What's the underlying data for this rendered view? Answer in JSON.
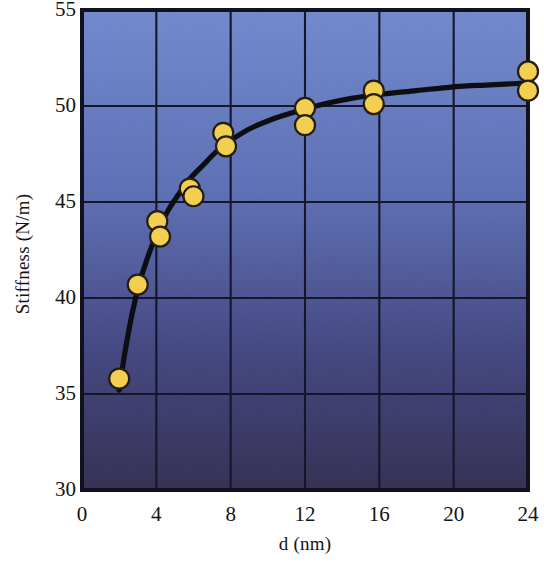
{
  "chart_data": {
    "type": "scatter",
    "title": "",
    "xlabel": "d (nm)",
    "ylabel": "Stiffness (N/m)",
    "xlim": [
      0,
      24
    ],
    "ylim": [
      30,
      55
    ],
    "xticks": [
      "0",
      "4",
      "8",
      "12",
      "16",
      "20",
      "24"
    ],
    "xtick_values": [
      0,
      4,
      8,
      12,
      16,
      20,
      24
    ],
    "yticks": [
      "30",
      "35",
      "40",
      "45",
      "50",
      "55"
    ],
    "ytick_values": [
      30,
      35,
      40,
      45,
      50,
      55
    ],
    "grid": true,
    "legend": "none",
    "series": [
      {
        "name": "measured stiffness",
        "marker": "circle",
        "marker_color": "#F2CF50",
        "marker_edge_color": "#241E12",
        "x": [
          2.0,
          3.0,
          4.05,
          4.2,
          5.8,
          6.0,
          7.6,
          7.75,
          12.0,
          12.0,
          15.7,
          15.7,
          24.0,
          24.0
        ],
        "y": [
          35.8,
          40.7,
          44.0,
          43.2,
          45.7,
          45.3,
          48.6,
          47.9,
          49.9,
          49.0,
          50.8,
          50.1,
          51.8,
          50.8
        ]
      },
      {
        "name": "fitted trend curve",
        "type": "line",
        "color": "#0D0D14",
        "x": [
          2.0,
          2.3,
          2.7,
          3.1,
          3.6,
          4.1,
          4.6,
          5.2,
          5.8,
          6.5,
          7.2,
          8.0,
          9.0,
          10.2,
          11.5,
          13.0,
          14.5,
          16.0,
          18.0,
          20.0,
          22.0,
          24.0
        ],
        "y": [
          35.2,
          37.1,
          39.2,
          40.8,
          42.3,
          43.5,
          44.5,
          45.4,
          46.2,
          46.9,
          47.6,
          48.2,
          48.8,
          49.3,
          49.7,
          50.1,
          50.4,
          50.6,
          50.8,
          51.0,
          51.1,
          51.2
        ]
      }
    ],
    "style": {
      "plot_bg_top": "#7089CC",
      "plot_bg_bottom": "#332F52",
      "grid_color": "#15162B",
      "frame_color": "#12121E",
      "page_bg": "#FFFFFF"
    },
    "geometry": {
      "plot_left": 82,
      "plot_right": 528,
      "plot_top": 10,
      "plot_bottom": 490
    }
  }
}
